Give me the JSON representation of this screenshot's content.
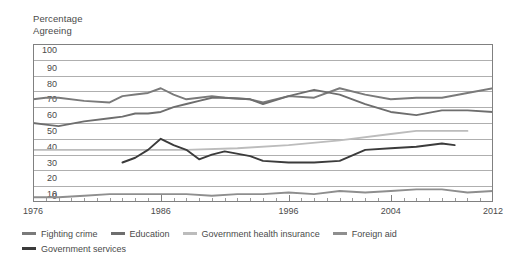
{
  "chart_data": {
    "type": "line",
    "title_line1": "Percentage",
    "title_line2": "Agreeing",
    "xlabel": "",
    "ylabel": "Percentage Agreeing",
    "xlim": [
      1976,
      2012
    ],
    "ylim": [
      0,
      100
    ],
    "grid": true,
    "legend_position": "bottom-left",
    "y_ticks": [
      100,
      90,
      80,
      70,
      60,
      50,
      40,
      30,
      20,
      10,
      0
    ],
    "x_ticks": [
      1976,
      1986,
      1996,
      2004,
      2012
    ],
    "x_tick_labels": [
      "1976",
      "1986",
      "1996",
      "2004",
      "2012"
    ],
    "x_minor_tick_step": 1,
    "series": [
      {
        "name": "Fighting crime",
        "color": "#7a7a7a",
        "x": [
          1976,
          1977,
          1978,
          1980,
          1982,
          1983,
          1984,
          1985,
          1986,
          1987,
          1988,
          1989,
          1990,
          1991,
          1993,
          1994,
          1996,
          1998,
          2000,
          2002,
          2004,
          2006,
          2008,
          2010,
          2012
        ],
        "values": [
          65,
          66,
          66,
          64,
          63,
          67,
          68,
          69,
          72,
          68,
          65,
          66,
          67,
          66,
          65,
          63,
          67,
          66,
          72,
          68,
          65,
          66,
          66,
          69,
          72
        ]
      },
      {
        "name": "Education",
        "color": "#6e6e6e",
        "x": [
          1976,
          1977,
          1978,
          1980,
          1982,
          1983,
          1984,
          1985,
          1986,
          1987,
          1988,
          1989,
          1990,
          1991,
          1993,
          1994,
          1996,
          1998,
          2000,
          2002,
          2004,
          2006,
          2008,
          2010,
          2012
        ],
        "values": [
          50,
          49,
          48,
          51,
          53,
          54,
          56,
          56,
          57,
          60,
          62,
          64,
          66,
          66,
          65,
          62,
          67,
          71,
          68,
          62,
          57,
          55,
          58,
          58,
          57
        ]
      },
      {
        "name": "Government health insurance",
        "color": "#bcbcbc",
        "x": [
          1976,
          1980,
          1984,
          1988,
          1992,
          1996,
          2000,
          2004,
          2006,
          2008,
          2010
        ],
        "values": [
          33,
          33,
          33,
          33,
          34,
          36,
          39,
          43,
          45,
          45,
          45
        ]
      },
      {
        "name": "Foreign aid",
        "color": "#8e8e8e",
        "x": [
          1976,
          1978,
          1980,
          1982,
          1984,
          1986,
          1988,
          1990,
          1992,
          1994,
          1996,
          1998,
          2000,
          2002,
          2004,
          2006,
          2008,
          2010,
          2012
        ],
        "values": [
          3,
          3,
          4,
          5,
          5,
          5,
          5,
          4,
          5,
          5,
          6,
          5,
          7,
          6,
          7,
          8,
          8,
          6,
          7
        ]
      },
      {
        "name": "Government services",
        "color": "#3b3b3b",
        "x": [
          1983,
          1984,
          1985,
          1986,
          1987,
          1988,
          1989,
          1990,
          1991,
          1993,
          1994,
          1996,
          1998,
          2000,
          2002,
          2004,
          2006,
          2008,
          2009
        ],
        "values": [
          25,
          28,
          33,
          40,
          36,
          33,
          27,
          30,
          32,
          29,
          26,
          25,
          25,
          26,
          33,
          34,
          35,
          37,
          36
        ]
      }
    ]
  }
}
